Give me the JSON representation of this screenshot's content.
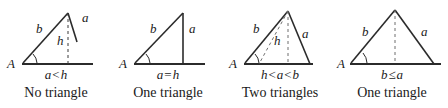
{
  "figure": {
    "background_color": "#ffffff",
    "stroke_color": "#2b2b2b",
    "dash_color": "#6e6e6e",
    "text_color": "#1a1a1a"
  },
  "panels": [
    {
      "id": "panel-no-triangle",
      "vertex_label": "A",
      "side_b_label": "b",
      "side_a_label": "a",
      "height_label": "h",
      "condition": "a < h",
      "condition_left": "a",
      "condition_op": "<",
      "condition_right": "h",
      "conclusion": "No triangle"
    },
    {
      "id": "panel-one-triangle-right",
      "vertex_label": "A",
      "side_b_label": "b",
      "side_a_label": "a",
      "height_label": "",
      "condition": "a = h",
      "condition_left": "a",
      "condition_op": "=",
      "condition_right": "h",
      "conclusion": "One triangle"
    },
    {
      "id": "panel-two-triangles",
      "vertex_label": "A",
      "side_b_label": "b",
      "side_a_label": "a",
      "height_label": "h",
      "condition": "h < a < b",
      "condition_left": "h",
      "condition_op": "<",
      "condition_mid": "a",
      "condition_op2": "<",
      "condition_right": "b",
      "conclusion": "Two triangles"
    },
    {
      "id": "panel-one-triangle-obtuse",
      "vertex_label": "A",
      "side_b_label": "b",
      "side_a_label": "a",
      "height_label": "",
      "condition": "b ≤ a",
      "condition_left": "b",
      "condition_op": "≤",
      "condition_right": "a",
      "conclusion": "One triangle"
    }
  ]
}
